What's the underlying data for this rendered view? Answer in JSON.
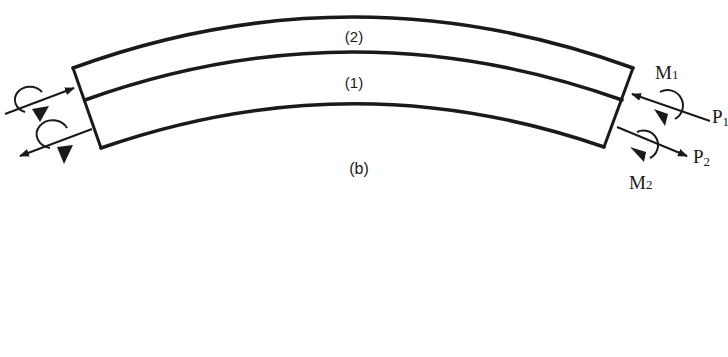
{
  "figure": {
    "panel_label": "(b)",
    "layers": [
      {
        "label": "(2)",
        "position": "top"
      },
      {
        "label": "(1)",
        "position": "bottom"
      }
    ],
    "loads": {
      "right": [
        {
          "label": "M",
          "subscript": "1",
          "type": "moment"
        },
        {
          "label": "P",
          "subscript": "1",
          "type": "force"
        },
        {
          "label": "M",
          "subscript": "2",
          "type": "moment"
        },
        {
          "label": "P",
          "subscript": "2",
          "type": "force"
        }
      ],
      "left": [
        {
          "type": "moment-and-force",
          "layer": "2"
        },
        {
          "type": "moment-and-force",
          "layer": "1"
        }
      ]
    },
    "colors": {
      "ink": "#1a1a1a",
      "background": "#ffffff"
    }
  }
}
